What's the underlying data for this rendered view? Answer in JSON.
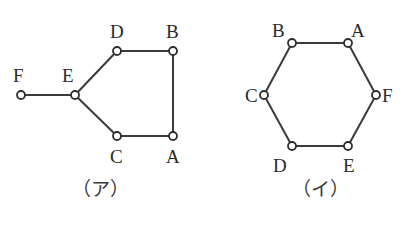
{
  "page": {
    "background_color": "#ffffff",
    "stroke_color": "#3a3a3a",
    "node_fill_color": "#ffffff",
    "node_stroke_color": "#2e2e2e",
    "text_color": "#2b2b2b"
  },
  "figures": [
    {
      "id": "figure-a",
      "caption": "（ア）",
      "caption_x": 100,
      "caption_y": 196,
      "nodes": [
        {
          "id": "F",
          "label": "F",
          "cx": 21,
          "cy": 95,
          "r": 4,
          "label_x": 13,
          "label_y": 82
        },
        {
          "id": "E",
          "label": "E",
          "cx": 75,
          "cy": 95,
          "r": 4,
          "label_x": 62,
          "label_y": 82
        },
        {
          "id": "D",
          "label": "D",
          "cx": 117,
          "cy": 51,
          "r": 4,
          "label_x": 110,
          "label_y": 38
        },
        {
          "id": "B",
          "label": "B",
          "cx": 173,
          "cy": 51,
          "r": 4,
          "label_x": 166,
          "label_y": 38
        },
        {
          "id": "C",
          "label": "C",
          "cx": 117,
          "cy": 136,
          "r": 4,
          "label_x": 110,
          "label_y": 163
        },
        {
          "id": "A",
          "label": "A",
          "cx": 173,
          "cy": 136,
          "r": 4,
          "label_x": 166,
          "label_y": 163
        }
      ],
      "edges": [
        {
          "from": "F",
          "to": "E"
        },
        {
          "from": "E",
          "to": "D"
        },
        {
          "from": "D",
          "to": "B"
        },
        {
          "from": "B",
          "to": "A"
        },
        {
          "from": "A",
          "to": "C"
        },
        {
          "from": "C",
          "to": "E"
        }
      ]
    },
    {
      "id": "figure-i",
      "caption": "（イ）",
      "caption_x": 320,
      "caption_y": 196,
      "nodes": [
        {
          "id": "B",
          "label": "B",
          "cx": 292,
          "cy": 43,
          "r": 4,
          "label_x": 272,
          "label_y": 37
        },
        {
          "id": "A",
          "label": "A",
          "cx": 348,
          "cy": 43,
          "r": 4,
          "label_x": 351,
          "label_y": 37
        },
        {
          "id": "C",
          "label": "C",
          "cx": 264,
          "cy": 95,
          "r": 4,
          "label_x": 245,
          "label_y": 102
        },
        {
          "id": "F",
          "label": "F",
          "cx": 376,
          "cy": 95,
          "r": 4,
          "label_x": 382,
          "label_y": 102
        },
        {
          "id": "D",
          "label": "D",
          "cx": 292,
          "cy": 146,
          "r": 4,
          "label_x": 273,
          "label_y": 172
        },
        {
          "id": "E",
          "label": "E",
          "cx": 348,
          "cy": 146,
          "r": 4,
          "label_x": 343,
          "label_y": 172
        }
      ],
      "edges": [
        {
          "from": "B",
          "to": "A"
        },
        {
          "from": "A",
          "to": "F"
        },
        {
          "from": "F",
          "to": "E"
        },
        {
          "from": "E",
          "to": "D"
        },
        {
          "from": "D",
          "to": "C"
        },
        {
          "from": "C",
          "to": "B"
        }
      ]
    }
  ]
}
